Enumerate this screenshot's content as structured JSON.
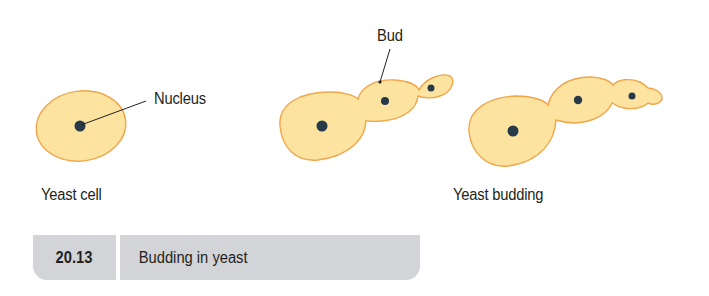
{
  "figure": {
    "labels": {
      "nucleus": "Nucleus",
      "bud": "Bud",
      "yeast_cell": "Yeast cell",
      "yeast_budding": "Yeast budding"
    },
    "caption": {
      "number": "20.13",
      "title": "Budding in yeast"
    },
    "colors": {
      "cell_fill": "#fce3a0",
      "cell_outline": "#f0a64b",
      "nucleus": "#263a4a",
      "leader_line": "#231f20",
      "caption_bg": "#d3d4d8"
    }
  }
}
